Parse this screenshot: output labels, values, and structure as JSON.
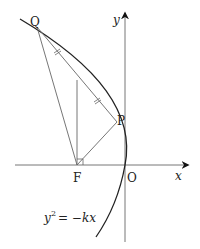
{
  "diagram": {
    "type": "parabola-geometry",
    "equation": {
      "lhs_base": "y",
      "lhs_exp": "2",
      "rhs": "= −kx"
    },
    "axes": {
      "x_label": "x",
      "y_label": "y",
      "origin_label": "O"
    },
    "points": {
      "focus": "F",
      "p": "P",
      "q": "Q"
    },
    "colors": {
      "line": "#555555",
      "curve": "#222222",
      "text": "#222222"
    }
  }
}
